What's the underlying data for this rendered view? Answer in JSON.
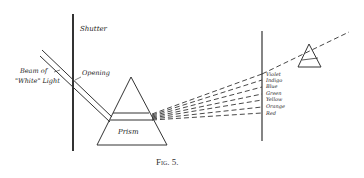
{
  "figure": {
    "caption": "Fig. 5.",
    "labels": {
      "shutter": "Shutter",
      "opening": "Opening",
      "beam_line1": "Beam of",
      "beam_line2": "\"White\" Light",
      "prism": "Prism"
    },
    "spectrum_colors": [
      "Violet",
      "Indigo",
      "Blue",
      "Green",
      "Yellow",
      "Orange",
      "Red"
    ],
    "ink_color": "#222222",
    "background": "#ffffff"
  }
}
